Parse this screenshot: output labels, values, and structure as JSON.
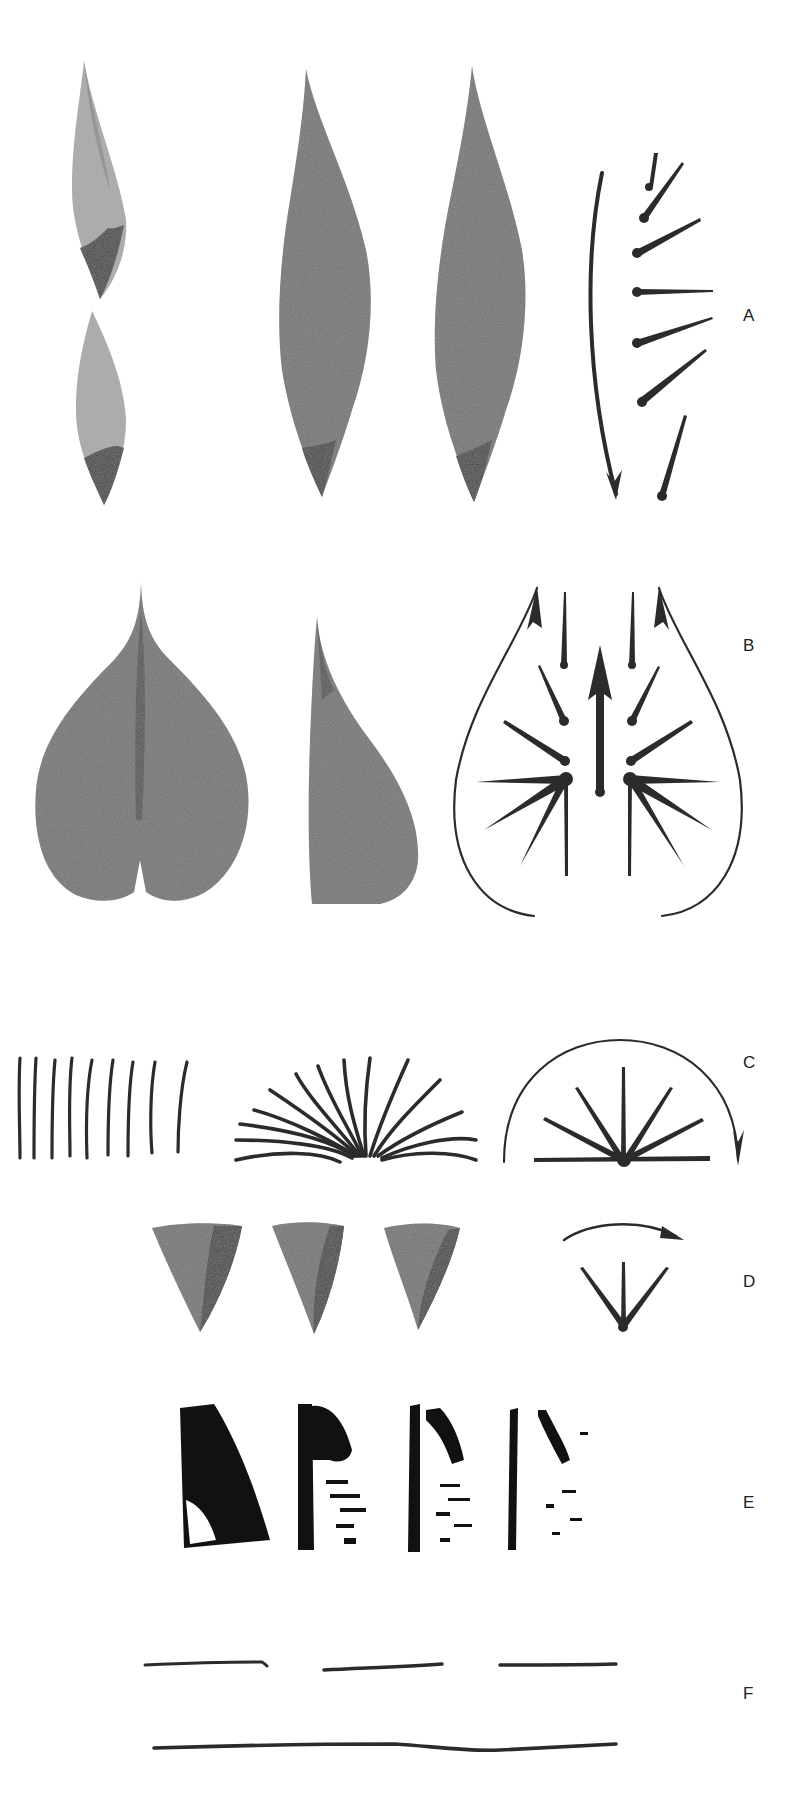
{
  "figure": {
    "background": "#ffffff",
    "ink_color": "#2b2b2b",
    "wash_color": "#6f6f6f",
    "sections": [
      {
        "label": "A",
        "description": "Long tapered leaf strokes with stroke-direction diagram (curved arrow and dotted radiating strokes)"
      },
      {
        "label": "B",
        "description": "Heart-shaped leaf and half leaf with radial stroke diagram and looping arrows"
      },
      {
        "label": "C",
        "description": "Parallel vertical strokes, fanned strokes, and semicircular radiating stroke diagram"
      },
      {
        "label": "D",
        "description": "Three triangular wash strokes with fan diagram and curved arrow"
      },
      {
        "label": "E",
        "description": "Four dry-brush block strokes of decreasing ink density"
      },
      {
        "label": "F",
        "description": "Three short horizontal strokes above one long horizontal stroke"
      }
    ]
  },
  "labels": {
    "a": "A",
    "b": "B",
    "c": "C",
    "d": "D",
    "e": "E",
    "f": "F"
  }
}
